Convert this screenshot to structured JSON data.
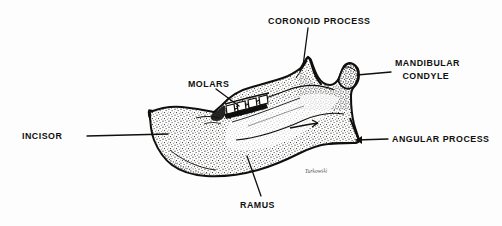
{
  "figure": {
    "style": "black and white stippled line drawing",
    "signature": "Turkowski"
  },
  "labels": {
    "coronoid_process": "CORONOID PROCESS",
    "mandibular_condyle_line1": "MANDIBULAR",
    "mandibular_condyle_line2": "CONDYLE",
    "angular_process": "ANGULAR PROCESS",
    "molars": "MOLARS",
    "incisor": "INCISOR",
    "ramus": "RAMUS"
  },
  "colors": {
    "ink": "#100f0d",
    "background": "#fdfdfd",
    "stipple": "#3a3733",
    "leader": "#100f0d"
  }
}
